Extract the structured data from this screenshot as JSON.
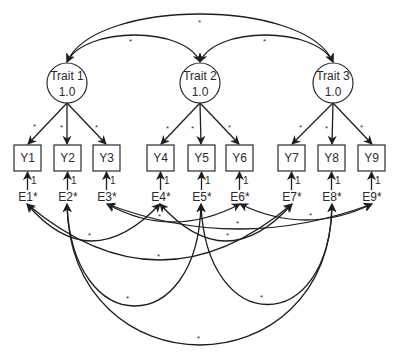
{
  "diagram": {
    "type": "structural-equation-model",
    "latent_factors": [
      {
        "id": "trait1",
        "name": "Trait 1",
        "variance": "1.0"
      },
      {
        "id": "trait2",
        "name": "Trait 2",
        "variance": "1.0"
      },
      {
        "id": "trait3",
        "name": "Trait 3",
        "variance": "1.0"
      }
    ],
    "factor_correlations": [
      {
        "from": "Trait 1",
        "to": "Trait 2",
        "label": "*"
      },
      {
        "from": "Trait 2",
        "to": "Trait 3",
        "label": "*"
      },
      {
        "from": "Trait 1",
        "to": "Trait 3",
        "label": "*"
      }
    ],
    "indicators": [
      "Y1",
      "Y2",
      "Y3",
      "Y4",
      "Y5",
      "Y6",
      "Y7",
      "Y8",
      "Y9"
    ],
    "loadings": [
      {
        "factor": "Trait 1",
        "indicator": "Y1",
        "label": "*"
      },
      {
        "factor": "Trait 1",
        "indicator": "Y2",
        "label": "*"
      },
      {
        "factor": "Trait 1",
        "indicator": "Y3",
        "label": "*"
      },
      {
        "factor": "Trait 2",
        "indicator": "Y4",
        "label": "*"
      },
      {
        "factor": "Trait 2",
        "indicator": "Y5",
        "label": "*"
      },
      {
        "factor": "Trait 2",
        "indicator": "Y6",
        "label": "*"
      },
      {
        "factor": "Trait 3",
        "indicator": "Y7",
        "label": "*"
      },
      {
        "factor": "Trait 3",
        "indicator": "Y8",
        "label": "*"
      },
      {
        "factor": "Trait 3",
        "indicator": "Y9",
        "label": "*"
      }
    ],
    "errors": [
      "E1*",
      "E2*",
      "E3*",
      "E4*",
      "E5*",
      "E6*",
      "E7*",
      "E8*",
      "E9*"
    ],
    "error_path_label": "1",
    "error_correlations": [
      {
        "from": "E1",
        "to": "E4",
        "label": "*"
      },
      {
        "from": "E1",
        "to": "E7",
        "label": "*"
      },
      {
        "from": "E4",
        "to": "E7",
        "label": "*"
      },
      {
        "from": "E3",
        "to": "E6",
        "label": "*"
      },
      {
        "from": "E3",
        "to": "E9",
        "label": "*"
      },
      {
        "from": "E6",
        "to": "E9",
        "label": "*"
      },
      {
        "from": "E2",
        "to": "E5",
        "label": "*"
      },
      {
        "from": "E5",
        "to": "E8",
        "label": "*"
      },
      {
        "from": "E2",
        "to": "E8",
        "label": "*"
      }
    ]
  }
}
